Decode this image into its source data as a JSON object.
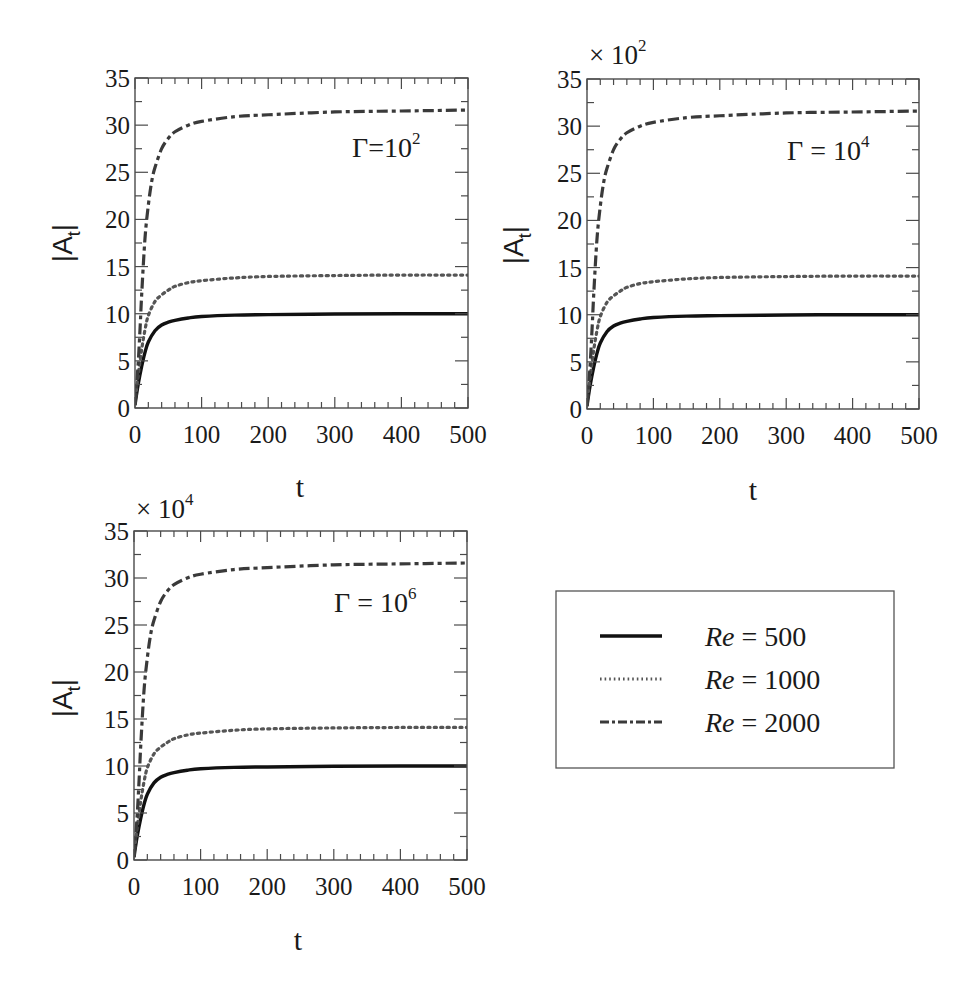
{
  "chart_data": [
    {
      "type": "line",
      "panel": "top-left",
      "title": "",
      "annotation": "Γ=10²",
      "annotation_parts": {
        "base": "Γ=10",
        "exp": "2"
      },
      "multiplier": "",
      "xlabel": "t",
      "ylabel": "|A_t|",
      "ylabel_parts": {
        "main": "|A",
        "sub": "t",
        "end": "|"
      },
      "xlim": [
        0,
        500
      ],
      "ylim": [
        0,
        35
      ],
      "xticks": [
        0,
        100,
        200,
        300,
        400,
        500
      ],
      "xtick_labels": [
        "0",
        "100",
        "200",
        "300",
        "400",
        "500"
      ],
      "yticks": [
        0,
        5,
        10,
        15,
        20,
        25,
        30,
        35
      ],
      "ytick_labels": [
        "0",
        "5",
        "10",
        "15",
        "20",
        "25",
        "30",
        "35"
      ],
      "x_minor_step": 20,
      "y_minor_step": 2.5,
      "grid": false
    },
    {
      "type": "line",
      "panel": "top-right",
      "title": "",
      "annotation": "Γ = 10⁴",
      "annotation_parts": {
        "base": "Γ = 10",
        "exp": "4"
      },
      "multiplier": "× 10²",
      "multiplier_parts": {
        "base": "× 10",
        "exp": "2"
      },
      "xlabel": "t",
      "ylabel": "|A_t|",
      "ylabel_parts": {
        "main": "|A",
        "sub": "t",
        "end": "|"
      },
      "xlim": [
        0,
        500
      ],
      "ylim": [
        0,
        35
      ],
      "xticks": [
        0,
        100,
        200,
        300,
        400,
        500
      ],
      "xtick_labels": [
        "0",
        "100",
        "200",
        "300",
        "400",
        "500"
      ],
      "yticks": [
        0,
        5,
        10,
        15,
        20,
        25,
        30,
        35
      ],
      "ytick_labels": [
        "0",
        "5",
        "10",
        "15",
        "20",
        "25",
        "30",
        "35"
      ],
      "x_minor_step": 20,
      "y_minor_step": 2.5,
      "grid": false
    },
    {
      "type": "line",
      "panel": "bottom-left",
      "title": "",
      "annotation": "Γ = 10⁶",
      "annotation_parts": {
        "base": "Γ = 10",
        "exp": "6"
      },
      "multiplier": "× 10⁴",
      "multiplier_parts": {
        "base": "× 10",
        "exp": "4"
      },
      "xlabel": "t",
      "ylabel": "|A_t|",
      "ylabel_parts": {
        "main": "|A",
        "sub": "t",
        "end": "|"
      },
      "xlim": [
        0,
        500
      ],
      "ylim": [
        0,
        35
      ],
      "xticks": [
        0,
        100,
        200,
        300,
        400,
        500
      ],
      "xtick_labels": [
        "0",
        "100",
        "200",
        "300",
        "400",
        "500"
      ],
      "yticks": [
        0,
        5,
        10,
        15,
        20,
        25,
        30,
        35
      ],
      "ytick_labels": [
        "0",
        "5",
        "10",
        "15",
        "20",
        "25",
        "30",
        "35"
      ],
      "x_minor_step": 20,
      "y_minor_step": 2.5,
      "grid": false
    }
  ],
  "series": [
    {
      "name": "Re = 500",
      "label_italic": "Re",
      "label_rest": " = 500",
      "style": "solid",
      "color": "#111111",
      "x": [
        0,
        2,
        5,
        10,
        15,
        20,
        30,
        40,
        50,
        60,
        80,
        100,
        150,
        200,
        300,
        400,
        500
      ],
      "values": [
        0.3,
        1.3,
        2.6,
        4.4,
        5.9,
        7.0,
        8.2,
        8.8,
        9.1,
        9.3,
        9.55,
        9.7,
        9.85,
        9.9,
        9.97,
        10.0,
        10.0
      ]
    },
    {
      "name": "Re = 1000",
      "label_italic": "Re",
      "label_rest": " = 1000",
      "style": "dotted",
      "color": "#555555",
      "x": [
        0,
        2,
        5,
        10,
        15,
        20,
        30,
        40,
        50,
        60,
        80,
        100,
        150,
        200,
        300,
        400,
        500
      ],
      "values": [
        0.5,
        1.8,
        3.6,
        6.2,
        8.3,
        9.8,
        11.3,
        12.0,
        12.5,
        12.9,
        13.3,
        13.5,
        13.8,
        13.95,
        14.05,
        14.1,
        14.1
      ]
    },
    {
      "name": "Re = 2000",
      "label_italic": "Re",
      "label_rest": " = 2000",
      "style": "dashdot",
      "color": "#333333",
      "x": [
        0,
        2,
        5,
        8,
        10,
        15,
        20,
        25,
        30,
        40,
        50,
        60,
        80,
        100,
        150,
        200,
        300,
        400,
        500
      ],
      "values": [
        0.5,
        2.0,
        5.0,
        9.0,
        12.0,
        18.0,
        21.5,
        24.0,
        25.5,
        27.5,
        28.6,
        29.3,
        30.0,
        30.4,
        30.9,
        31.1,
        31.4,
        31.5,
        31.6
      ]
    }
  ],
  "legend": {
    "placement": "bottom-right",
    "entries": [
      {
        "italic": "Re",
        "rest": " = 500"
      },
      {
        "italic": "Re",
        "rest": " = 1000"
      },
      {
        "italic": "Re",
        "rest": " = 2000"
      }
    ]
  }
}
